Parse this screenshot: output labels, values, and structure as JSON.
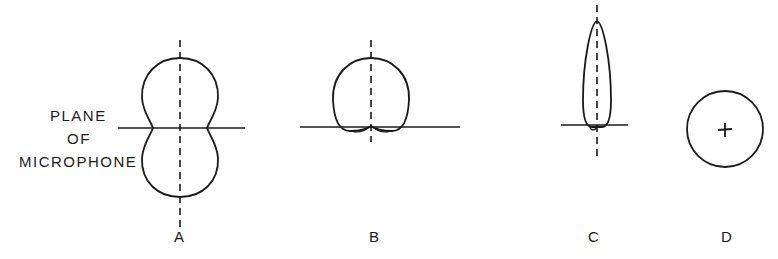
{
  "diagram": {
    "plane_label": {
      "lines": [
        "PLANE",
        "OF",
        "MICROPHONE"
      ]
    },
    "figures": [
      {
        "id": "A",
        "label": "A",
        "pattern": "figure-eight (bidirectional)"
      },
      {
        "id": "B",
        "label": "B",
        "pattern": "cardioid (unidirectional)"
      },
      {
        "id": "C",
        "label": "C",
        "pattern": "highly directional lobe"
      },
      {
        "id": "D",
        "label": "D",
        "pattern": "omnidirectional circle (top view)"
      }
    ],
    "colors": {
      "ink": "#1a1a1a",
      "background": "#ffffff"
    }
  }
}
